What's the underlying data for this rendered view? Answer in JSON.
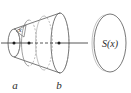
{
  "figure": {
    "background_color": "#ffffff",
    "stroke_color": "#555555",
    "dash_color": "#8a8a8a",
    "label_color": "#2b2b2b",
    "labels": {
      "left_bound": "a",
      "right_bound": "b",
      "slice_position": "x",
      "cross_section_area": "S(x)"
    },
    "elements": {
      "solid_name": "frustum-solid",
      "axis_name": "x-axis",
      "left_cap_name": "left-end-ellipse",
      "slice_name": "cross-section-ellipse",
      "right_cap_name": "right-end-ellipse",
      "detached_name": "detached-cross-section-ellipse"
    },
    "markers": [
      {
        "name": "marker-a",
        "x": 14,
        "y": 43
      },
      {
        "name": "marker-x",
        "x": 29,
        "y": 43
      },
      {
        "name": "marker-b",
        "x": 59,
        "y": 43
      }
    ]
  }
}
